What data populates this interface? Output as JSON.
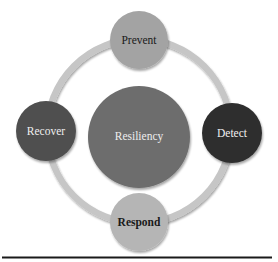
{
  "diagram": {
    "type": "cycle",
    "center": {
      "label": "Resiliency",
      "color": "#6d6d6d",
      "text_color": "#eeeeee"
    },
    "ring_color": "#c6c6c6",
    "nodes": [
      {
        "id": "prevent",
        "label": "Prevent",
        "position": "top",
        "color": "#a3a3a3",
        "text_color": "#1a1a1a"
      },
      {
        "id": "detect",
        "label": "Detect",
        "position": "right",
        "color": "#2e2e2e",
        "text_color": "#f0f0f0"
      },
      {
        "id": "respond",
        "label": "Respond",
        "position": "bottom",
        "color": "#b5b5b5",
        "text_color": "#1a1a1a"
      },
      {
        "id": "recover",
        "label": "Recover",
        "position": "left",
        "color": "#4f4f4f",
        "text_color": "#eeeeee"
      }
    ]
  }
}
